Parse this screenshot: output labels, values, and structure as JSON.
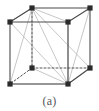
{
  "figure": {
    "caption": "(a)",
    "colors": {
      "atom": "#2b2b2b",
      "solid_edge": "#4a4a4a",
      "hidden_edge": "#555555",
      "bond_line": "#b9b9b9",
      "background": "#ffffff",
      "caption_text": "#555555"
    },
    "style": {
      "atom_radius": 2.6,
      "solid_edge_width": 1.1,
      "hidden_edge_width": 1.0,
      "hidden_edge_dash": "2,2",
      "bond_line_width": 0.8
    }
  },
  "chart_data": {
    "type": "diagram",
    "subtitle": "(a)",
    "projection": "oblique",
    "atoms": [
      {
        "id": "front-top-left",
        "label": "A",
        "x": 10,
        "y": 22,
        "visible": true
      },
      {
        "id": "front-top-right",
        "label": "B",
        "x": 68,
        "y": 22,
        "visible": true
      },
      {
        "id": "front-bottom-left",
        "label": "C",
        "x": 10,
        "y": 84,
        "visible": true
      },
      {
        "id": "front-bottom-right",
        "label": "D",
        "x": 68,
        "y": 84,
        "visible": true
      },
      {
        "id": "back-top-left",
        "label": "E",
        "x": 32,
        "y": 8,
        "visible": true
      },
      {
        "id": "back-top-right",
        "label": "F",
        "x": 90,
        "y": 8,
        "visible": true
      },
      {
        "id": "back-bottom-left",
        "label": "G",
        "x": 32,
        "y": 68,
        "visible": false
      },
      {
        "id": "back-bottom-right",
        "label": "H",
        "x": 90,
        "y": 68,
        "visible": true
      }
    ],
    "solid_edges": [
      [
        "front-top-left",
        "front-top-right"
      ],
      [
        "front-top-right",
        "front-bottom-right"
      ],
      [
        "front-bottom-right",
        "front-bottom-left"
      ],
      [
        "front-bottom-left",
        "front-top-left"
      ],
      [
        "back-top-left",
        "back-top-right"
      ],
      [
        "back-top-right",
        "back-bottom-right"
      ],
      [
        "front-top-left",
        "back-top-left"
      ],
      [
        "front-top-right",
        "back-top-right"
      ],
      [
        "front-bottom-right",
        "back-bottom-right"
      ]
    ],
    "hidden_edges": [
      [
        "back-top-left",
        "back-bottom-left"
      ],
      [
        "back-bottom-left",
        "back-bottom-right"
      ],
      [
        "back-bottom-left",
        "front-bottom-left"
      ]
    ],
    "bond_lines": [
      [
        "back-top-left",
        "front-top-left"
      ],
      [
        "back-top-left",
        "front-top-right"
      ],
      [
        "back-top-left",
        "front-bottom-left"
      ],
      [
        "back-top-left",
        "front-bottom-right"
      ],
      [
        "back-top-left",
        "back-bottom-right"
      ],
      [
        "back-top-left",
        "back-bottom-left"
      ],
      [
        "front-bottom-right",
        "front-bottom-left"
      ],
      [
        "front-bottom-right",
        "back-bottom-left"
      ],
      [
        "front-bottom-right",
        "front-top-left"
      ],
      [
        "front-bottom-right",
        "front-top-right"
      ],
      [
        "front-bottom-right",
        "back-top-right"
      ],
      [
        "front-bottom-right",
        "back-bottom-right"
      ]
    ]
  }
}
